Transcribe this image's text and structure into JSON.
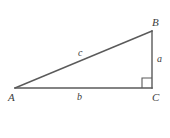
{
  "figure": {
    "kind": "right-triangle-diagram",
    "background_color": "#ffffff",
    "stroke_color": "#5a5a5a",
    "label_color": "#3d3d3d",
    "vertices": {
      "A": {
        "label": "A",
        "x": 15,
        "y": 88
      },
      "B": {
        "label": "B",
        "x": 152,
        "y": 31
      },
      "C": {
        "label": "C",
        "x": 152,
        "y": 88
      }
    },
    "sides": {
      "a": {
        "label": "a",
        "from": "B",
        "to": "C",
        "description": "vertical leg"
      },
      "b": {
        "label": "b",
        "from": "A",
        "to": "C",
        "description": "horizontal leg"
      },
      "c": {
        "label": "c",
        "from": "A",
        "to": "B",
        "description": "hypotenuse"
      }
    },
    "right_angle": {
      "at_vertex": "C",
      "marker": "square",
      "size": 10
    }
  }
}
